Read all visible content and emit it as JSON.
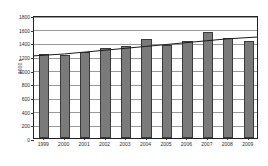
{
  "chart_data": {
    "type": "bar",
    "title": "",
    "subtitle": "",
    "xlabel": "",
    "ylabel": "1000 t",
    "categories": [
      "1999",
      "2000",
      "2001",
      "2002",
      "2003",
      "2004",
      "2005",
      "2006",
      "2007",
      "2008",
      "2009"
    ],
    "values": [
      1225,
      1220,
      1255,
      1320,
      1345,
      1455,
      1355,
      1415,
      1545,
      1470,
      1415
    ],
    "ylim": [
      0,
      1800
    ],
    "ytick_values": [
      0,
      200,
      400,
      600,
      800,
      1000,
      1200,
      1400,
      1600,
      1800
    ],
    "ytick_labels": [
      "0",
      "200",
      "400",
      "600",
      "800",
      "1000",
      "1200",
      "1400",
      "1600",
      "1800"
    ],
    "grid": true,
    "grid_axis": "y",
    "legend": false,
    "legend_position": "none",
    "series": [
      {
        "name": "bars",
        "type": "bar",
        "color": "#7a7a7a",
        "edge_color": "#3b3b3b",
        "values": [
          1225,
          1220,
          1255,
          1320,
          1345,
          1455,
          1355,
          1415,
          1545,
          1470,
          1415
        ]
      },
      {
        "name": "trend",
        "type": "line",
        "color": "#1a1a1a",
        "values": [
          1222,
          1250,
          1278,
          1306,
          1334,
          1362,
          1390,
          1418,
          1446,
          1474,
          1502
        ]
      }
    ],
    "annotations": []
  },
  "colors": {
    "background": "#ffffff",
    "bar_fill": "#7a7a7a",
    "bar_edge": "#3b3b3b",
    "grid": "#9a9a9a",
    "frame": "#222222",
    "trend_line": "#1a1a1a",
    "text": "#2b2b2b"
  }
}
